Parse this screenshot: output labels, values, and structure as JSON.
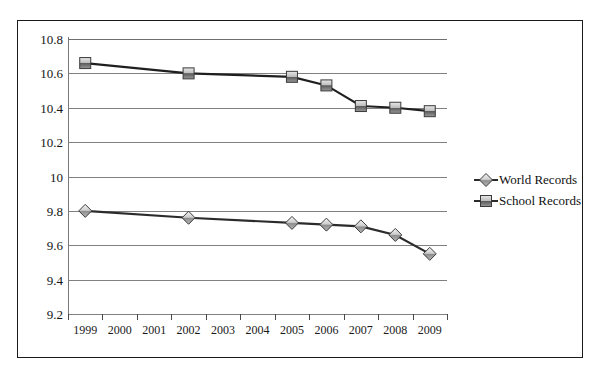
{
  "chart_data": {
    "type": "line",
    "title": "",
    "subtitle": "",
    "xlabel": "",
    "ylabel": "",
    "categories": [
      "1999",
      "2000",
      "2001",
      "2002",
      "2003",
      "2004",
      "2005",
      "2006",
      "2007",
      "2008",
      "2009"
    ],
    "ylim": [
      9.2,
      10.8
    ],
    "y_ticks": [
      "10.8",
      "10.6",
      "10.4",
      "10.2",
      "10",
      "9.8",
      "9.6",
      "9.4",
      "9.2"
    ],
    "y_tick_values": [
      10.8,
      10.6,
      10.4,
      10.2,
      10.0,
      9.8,
      9.6,
      9.4,
      9.2
    ],
    "grid": true,
    "legend_position": "right",
    "series": [
      {
        "name": "World Records",
        "marker": "diamond",
        "color": "#a8a8a8",
        "line_color": "#2b2b2b",
        "points": [
          {
            "x": "1999",
            "y": 9.8
          },
          {
            "x": "2002",
            "y": 9.76
          },
          {
            "x": "2005",
            "y": 9.73
          },
          {
            "x": "2006",
            "y": 9.72
          },
          {
            "x": "2007",
            "y": 9.71
          },
          {
            "x": "2008",
            "y": 9.66
          },
          {
            "x": "2009",
            "y": 9.55
          }
        ]
      },
      {
        "name": "School Records",
        "marker": "square",
        "color": "#808080",
        "line_color": "#1f1f1f",
        "points": [
          {
            "x": "1999",
            "y": 10.66
          },
          {
            "x": "2002",
            "y": 10.6
          },
          {
            "x": "2005",
            "y": 10.58
          },
          {
            "x": "2006",
            "y": 10.53
          },
          {
            "x": "2007",
            "y": 10.41
          },
          {
            "x": "2008",
            "y": 10.4
          },
          {
            "x": "2009",
            "y": 10.38
          }
        ]
      }
    ]
  },
  "legend": {
    "items": [
      {
        "label": "World Records",
        "marker": "diamond"
      },
      {
        "label": "School Records",
        "marker": "square"
      }
    ]
  }
}
